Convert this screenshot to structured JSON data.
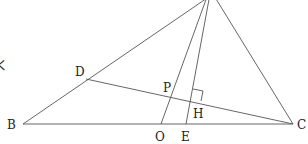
{
  "diagram": {
    "type": "geometry-triangle",
    "points": {
      "A": {
        "x": 213,
        "y": -6,
        "label": ""
      },
      "B": {
        "x": 23,
        "y": 124,
        "label": "B"
      },
      "C": {
        "x": 293,
        "y": 124,
        "label": "C"
      },
      "D": {
        "x": 86,
        "y": 79,
        "label": "D"
      },
      "O": {
        "x": 161,
        "y": 124,
        "label": "O"
      },
      "E": {
        "x": 186,
        "y": 124,
        "label": "E"
      },
      "P": {
        "x": 176,
        "y": 97,
        "label": "P"
      },
      "H": {
        "x": 191,
        "y": 100,
        "label": "H"
      }
    },
    "segments": [
      "AB",
      "AC",
      "BC",
      "AO",
      "AE",
      "DC"
    ],
    "right_angle_at": "H",
    "partial_left_text": "く"
  }
}
